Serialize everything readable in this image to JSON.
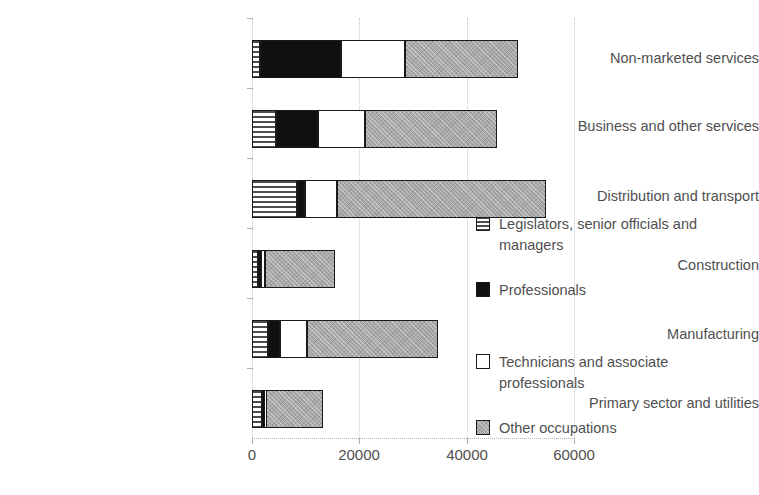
{
  "chart_data": {
    "type": "bar",
    "orientation": "horizontal",
    "stacked": true,
    "title": "",
    "xlabel": "",
    "ylabel": "",
    "xlim": [
      0,
      60000
    ],
    "xticks": [
      "0",
      "20000",
      "40000",
      "60000"
    ],
    "xtick_values": [
      0,
      20000,
      40000,
      60000
    ],
    "grid": "vertical-dotted",
    "legend_position": "right-middle",
    "categories": [
      "Non-marketed services",
      "Business and other services",
      "Distribution and transport",
      "Construction",
      "Manufacturing",
      "Primary sector and utilities"
    ],
    "series": [
      {
        "name": "Legislators, senior officials and managers",
        "key": "legislators",
        "color": "#f2f2f2",
        "pattern": "horizontal-stripes",
        "values": [
          1400,
          4500,
          8400,
          1100,
          3000,
          1900
        ]
      },
      {
        "name": "Professionals",
        "key": "professionals",
        "color": "#101010",
        "pattern": "solid-black",
        "values": [
          15100,
          7800,
          1500,
          600,
          2200,
          400
        ]
      },
      {
        "name": "Technicians and associate professionals",
        "key": "technicians",
        "color": "#ffffff",
        "pattern": "solid-white",
        "values": [
          12100,
          8800,
          6000,
          700,
          5000,
          300
        ]
      },
      {
        "name": "Other occupations",
        "key": "other",
        "color": "#a8a8a8",
        "pattern": "grey-texture",
        "values": [
          21000,
          24600,
          38800,
          13100,
          24400,
          10600
        ]
      }
    ],
    "totals": [
      49600,
      45700,
      54700,
      15500,
      34600,
      13200
    ]
  },
  "legend": {
    "items": [
      {
        "label": "Legislators, senior officials and managers",
        "key": "legislators"
      },
      {
        "label": "Professionals",
        "key": "professionals"
      },
      {
        "label": "Technicians and associate professionals",
        "key": "technicians"
      },
      {
        "label": "Other occupations",
        "key": "other"
      }
    ]
  }
}
